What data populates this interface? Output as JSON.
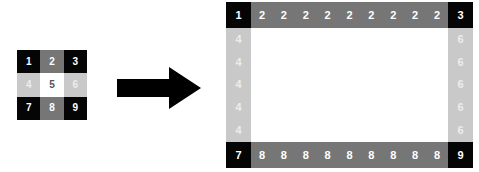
{
  "figure": {
    "background": "#ffffff"
  },
  "palette": {
    "black": "#050505",
    "dark_gray": "#767676",
    "light_gray": "#c9c9c9",
    "white": "#ffffff",
    "label_white": "#ffffff",
    "label_faint": "#e8e8e8",
    "label_dark": "#555555",
    "arrow": "#000000"
  },
  "source_grid": {
    "name": "source-3x3-grid",
    "rows": 3,
    "cols": 3,
    "cells": [
      {
        "value": "1",
        "fill": "#050505",
        "text": "#ffffff"
      },
      {
        "value": "2",
        "fill": "#767676",
        "text": "#ffffff"
      },
      {
        "value": "3",
        "fill": "#050505",
        "text": "#ffffff"
      },
      {
        "value": "4",
        "fill": "#c9c9c9",
        "text": "#ededed"
      },
      {
        "value": "5",
        "fill": "#ffffff",
        "text": "#555555"
      },
      {
        "value": "6",
        "fill": "#c9c9c9",
        "text": "#ededed"
      },
      {
        "value": "7",
        "fill": "#050505",
        "text": "#ffffff"
      },
      {
        "value": "8",
        "fill": "#767676",
        "text": "#ffffff"
      },
      {
        "value": "9",
        "fill": "#050505",
        "text": "#ffffff"
      }
    ]
  },
  "arrow": {
    "name": "right-arrow-icon",
    "direction": "right",
    "color": "#000000"
  },
  "target_grid": {
    "name": "expanded-border-grid",
    "corners": {
      "top_left": {
        "value": "1",
        "fill": "#050505",
        "text": "#ffffff"
      },
      "top_right": {
        "value": "3",
        "fill": "#050505",
        "text": "#ffffff"
      },
      "bottom_left": {
        "value": "7",
        "fill": "#050505",
        "text": "#ffffff"
      },
      "bottom_right": {
        "value": "9",
        "fill": "#050505",
        "text": "#ffffff"
      }
    },
    "top_edge": {
      "value": "2",
      "fill": "#767676",
      "text": "#ffffff",
      "repeat": 9,
      "values": [
        "2",
        "2",
        "2",
        "2",
        "2",
        "2",
        "2",
        "2",
        "2"
      ]
    },
    "bottom_edge": {
      "value": "8",
      "fill": "#767676",
      "text": "#ffffff",
      "repeat": 9,
      "values": [
        "8",
        "8",
        "8",
        "8",
        "8",
        "8",
        "8",
        "8",
        "8"
      ]
    },
    "left_edge": {
      "value": "4",
      "fill": "#c9c9c9",
      "text": "#ededed",
      "repeat": 5,
      "values": [
        "4",
        "4",
        "4",
        "4",
        "4"
      ]
    },
    "right_edge": {
      "value": "6",
      "fill": "#c9c9c9",
      "text": "#ededed",
      "repeat": 5,
      "values": [
        "6",
        "6",
        "6",
        "6",
        "6"
      ]
    },
    "center": {
      "value": "",
      "fill": "#ffffff",
      "text": "#555555"
    }
  }
}
